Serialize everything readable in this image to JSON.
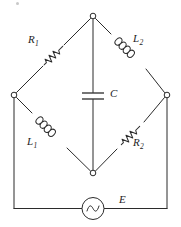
{
  "figure": {
    "background_color": "#ffffff",
    "line_color": "#2b2b2b"
  },
  "labels": {
    "r1": {
      "base": "R",
      "sub": "1"
    },
    "r2": {
      "base": "R",
      "sub": "2"
    },
    "l1": {
      "base": "L",
      "sub": "1"
    },
    "l2": {
      "base": "L",
      "sub": "2"
    },
    "c": {
      "base": "C",
      "sub": ""
    },
    "e": {
      "base": "E",
      "sub": ""
    }
  },
  "components": [
    {
      "id": "R1",
      "type": "resistor",
      "label": "R1",
      "branch": "left-node-to-top-node",
      "position": "upper-left-diagonal"
    },
    {
      "id": "L2",
      "type": "inductor",
      "label": "L2",
      "branch": "top-node-to-right-node",
      "position": "upper-right-diagonal"
    },
    {
      "id": "L1",
      "type": "inductor",
      "label": "L1",
      "branch": "left-node-to-bottom-node",
      "position": "lower-left-diagonal"
    },
    {
      "id": "R2",
      "type": "resistor",
      "label": "R2",
      "branch": "bottom-node-to-right-node",
      "position": "lower-right-diagonal"
    },
    {
      "id": "C",
      "type": "capacitor",
      "label": "C",
      "branch": "top-node-to-bottom-node",
      "position": "vertical-center"
    },
    {
      "id": "E",
      "type": "ac-source",
      "label": "E",
      "branch": "bottom-rail",
      "position": "bottom-center"
    }
  ],
  "nodes": [
    {
      "id": "top",
      "x": 93,
      "y": 16
    },
    {
      "id": "left",
      "x": 14,
      "y": 95
    },
    {
      "id": "right",
      "x": 167,
      "y": 95
    },
    {
      "id": "bottom",
      "x": 93,
      "y": 173
    }
  ]
}
